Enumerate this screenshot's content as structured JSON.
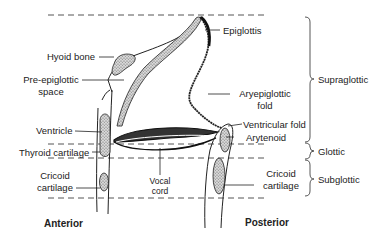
{
  "diagram": {
    "labels": {
      "hyoid_bone": "Hyoid bone",
      "pre_epiglottic_space_1": "Pre-epiglottic",
      "pre_epiglottic_space_2": "space",
      "epiglottis": "Epiglottis",
      "aryepiglottic_fold_1": "Aryepiglottic",
      "aryepiglottic_fold_2": "fold",
      "ventricle": "Ventricle",
      "ventricular_fold": "Ventricular fold",
      "arytenoid": "Arytenoid",
      "thyroid_cartilage": "Thyroid cartilage",
      "cricoid_cartilage_anterior_1": "Cricoid",
      "cricoid_cartilage_anterior_2": "cartilage",
      "vocal_cord_1": "Vocal",
      "vocal_cord_2": "cord",
      "cricoid_cartilage_posterior_1": "Cricoid",
      "cricoid_cartilage_posterior_2": "cartilage"
    },
    "regions": [
      {
        "name": "Supraglottic"
      },
      {
        "name": "Glottic"
      },
      {
        "name": "Subglottic"
      }
    ],
    "orientation": {
      "anterior": "Anterior",
      "posterior": "Posterior"
    },
    "colors": {
      "line": "#222222",
      "dash": "#555555",
      "stipple": "#888888",
      "background": "#ffffff"
    }
  }
}
